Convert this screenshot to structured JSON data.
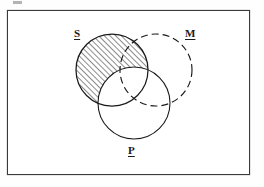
{
  "page": {
    "background_color": "#fefefe",
    "width": 264,
    "height": 187
  },
  "frame": {
    "name": "diagram-border",
    "stroke_color": "#3a3a3a",
    "x": 7,
    "y": 10,
    "width": 243,
    "height": 165
  },
  "artifact": {
    "name": "scan-artifact",
    "color": "#9a9a9a"
  },
  "diagram": {
    "type": "three-circle-venn-syllogism",
    "labels": {
      "S": "S",
      "M": "M",
      "P": "P"
    },
    "circles": [
      {
        "id": "S",
        "label": "S",
        "cx": 112,
        "cy": 70,
        "r": 36,
        "stroke_style": "solid",
        "stroke_color": "#1a1a1a",
        "fill": "none",
        "shaded": true,
        "shading": "diagonal-hatch-45",
        "shaded_region": "S minus P"
      },
      {
        "id": "M",
        "label": "M",
        "cx": 156,
        "cy": 70,
        "r": 36,
        "stroke_style": "dashed",
        "stroke_color": "#1a1a1a",
        "fill": "none",
        "shaded": false,
        "shading": "none",
        "shaded_region": ""
      },
      {
        "id": "P",
        "label": "P",
        "cx": 134,
        "cy": 103,
        "r": 36,
        "stroke_style": "solid",
        "stroke_color": "#1a1a1a",
        "fill": "none",
        "shaded": false,
        "shading": "none",
        "shaded_region": ""
      }
    ],
    "hatch": {
      "color": "#1a1a1a",
      "angle_degrees": 45,
      "spacing_px": 3,
      "line_width_px": 1
    },
    "dash_pattern": "7 4"
  }
}
